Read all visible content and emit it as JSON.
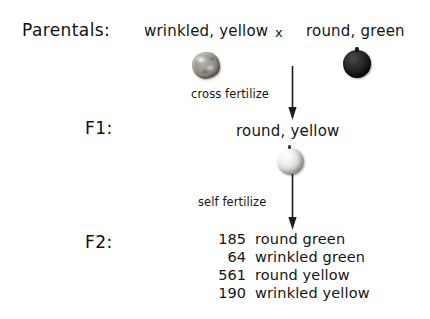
{
  "figure": {
    "background_color": "#ffffff",
    "ink_color": "#141414"
  },
  "parentals": {
    "label": "Parentals:",
    "left_phenotype": "wrinkled, yellow",
    "cross_symbol": "x",
    "right_phenotype": "round, green",
    "left_seed_icon": "wrinkled-yellow-pea-icon",
    "right_seed_icon": "round-green-pea-icon"
  },
  "steps": {
    "cross_fertilize": "cross fertilize",
    "self_fertilize": "self fertilize",
    "arrow_icon": "down-arrow-icon"
  },
  "f1": {
    "label": "F1:",
    "phenotype": "round, yellow",
    "seed_icon": "round-yellow-pea-icon"
  },
  "f2": {
    "label": "F2:",
    "results": [
      {
        "count": "185",
        "phenotype": "round green"
      },
      {
        "count": "64",
        "phenotype": "wrinkled green"
      },
      {
        "count": "561",
        "phenotype": "round yellow"
      },
      {
        "count": "190",
        "phenotype": "wrinkled yellow"
      }
    ]
  }
}
